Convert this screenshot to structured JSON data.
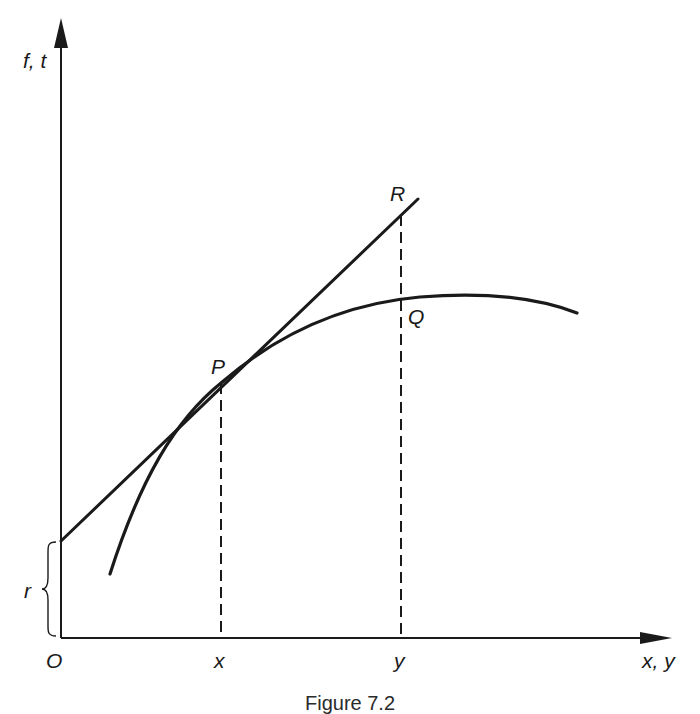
{
  "figure": {
    "caption": "Figure 7.2",
    "axes": {
      "y_label": "f, t",
      "x_label": "x, y",
      "origin_label": "O"
    },
    "ticks": {
      "x_tick": "x",
      "y_tick": "y"
    },
    "points": {
      "P": "P",
      "Q": "Q",
      "R": "R"
    },
    "brace_label": "r",
    "elements": [
      {
        "name": "curve",
        "description": "concave curve f rising through P and Q, peaking right of Q"
      },
      {
        "name": "tangent",
        "description": "straight line t tangent to curve at P, intercept r on vertical axis, passing through R"
      },
      {
        "name": "dashed-x",
        "description": "vertical dashed line from P down to x on horizontal axis"
      },
      {
        "name": "dashed-y",
        "description": "vertical dashed line from R through Q down to y on horizontal axis"
      }
    ],
    "colors": {
      "ink": "#1a1a1a",
      "background": "#ffffff"
    }
  }
}
